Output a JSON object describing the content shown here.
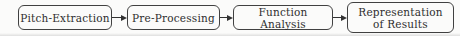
{
  "diagram": {
    "type": "flowchart",
    "direction": "left-to-right",
    "colors": {
      "border": "#414141",
      "text": "#2e2e2e",
      "arrow": "#333333",
      "background": "#fbfbfa"
    },
    "nodes": [
      {
        "id": "pitch-extraction",
        "label": "Pitch-Extraction"
      },
      {
        "id": "pre-processing",
        "label": "Pre-Processing"
      },
      {
        "id": "function-analysis",
        "label": "Function Analysis"
      },
      {
        "id": "representation-of-results",
        "label": "Representation of Results",
        "lines": [
          "Representation",
          "of Results"
        ]
      }
    ],
    "connections": [
      {
        "from": "pitch-extraction",
        "to": "pre-processing"
      },
      {
        "from": "pre-processing",
        "to": "function-analysis"
      },
      {
        "from": "function-analysis",
        "to": "representation-of-results"
      }
    ]
  }
}
